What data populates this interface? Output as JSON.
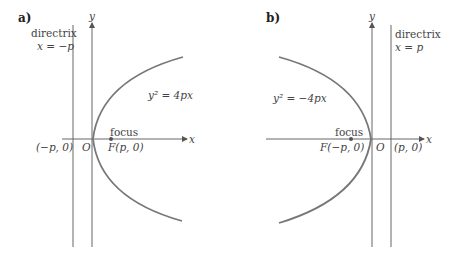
{
  "panels": [
    {
      "label": "a)",
      "y_axis_label": "y",
      "x_axis_label": "x",
      "directrix_title": "directrix",
      "directrix_equation": "x = −p",
      "equation": "y² = 4px",
      "focus_title": "focus",
      "focus_point": "F(p, 0)",
      "directrix_point": "(−p, 0)",
      "origin": "O"
    },
    {
      "label": "b)",
      "y_axis_label": "y",
      "x_axis_label": "x",
      "directrix_title": "directrix",
      "directrix_equation": "x = p",
      "equation": "y² = −4px",
      "focus_title": "focus",
      "focus_point": "F(−p, 0)",
      "directrix_point": "(p, 0)",
      "origin": "O"
    }
  ],
  "colors": {
    "curve": "#777777",
    "axis": "#666666",
    "text": "#444444"
  }
}
